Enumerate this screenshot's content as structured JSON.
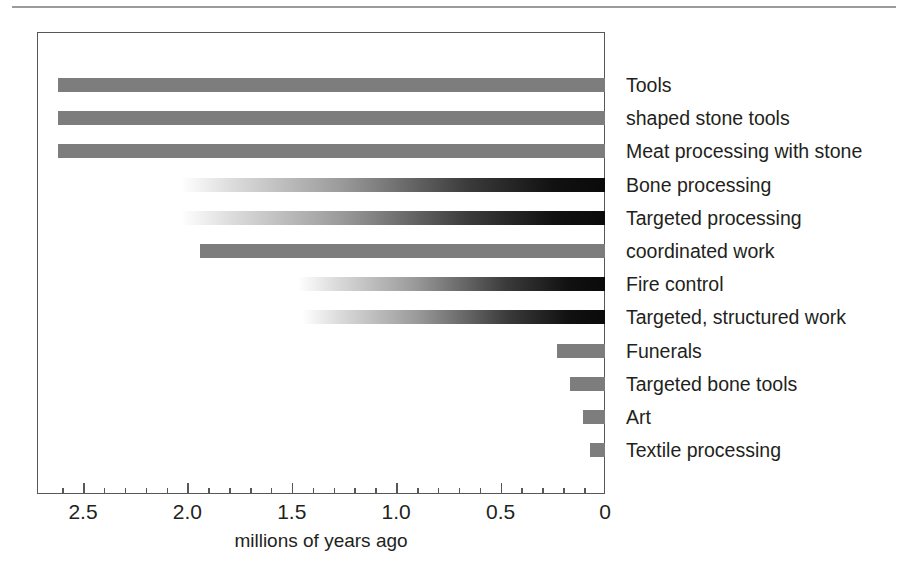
{
  "figure": {
    "background_color": "#ffffff",
    "rule_color": "#9b9b9b",
    "frame_color": "#575757",
    "text_color": "#231f20"
  },
  "chart_data": {
    "type": "bar",
    "orientation": "horizontal",
    "title": "",
    "subtitle": "",
    "xlabel": "millions of years ago",
    "ylabel": "",
    "xlim": [
      2.72,
      0
    ],
    "x_axis_reversed": true,
    "grid": false,
    "legend": null,
    "tick_labels": [
      "2.5",
      "2.0",
      "1.5",
      "1.0",
      "0.5",
      "0"
    ],
    "tick_values": [
      2.5,
      2.0,
      1.5,
      1.0,
      0.5,
      0
    ],
    "minor_tick_step": 0.1,
    "bar_colors": {
      "solid_gray": "#7d7d7d",
      "gradient_black": "#0a0a0a",
      "gradient_start": "#ffffff"
    },
    "categories": [
      "Tools",
      "shaped stone tools",
      "Meat processing with stone",
      "Bone processing",
      "Targeted processing",
      "coordinated work",
      "Fire control",
      "Targeted, structured work",
      "Funerals",
      "Targeted bone tools",
      "Art",
      "Textile processing"
    ],
    "values": [
      2.62,
      2.62,
      2.62,
      2.03,
      2.03,
      1.94,
      1.47,
      1.45,
      0.23,
      0.17,
      0.105,
      0.07
    ],
    "bars": [
      {
        "label": "Tools",
        "value": 2.62,
        "style": "solid"
      },
      {
        "label": "shaped stone tools",
        "value": 2.62,
        "style": "solid"
      },
      {
        "label": "Meat processing with stone",
        "value": 2.62,
        "style": "solid"
      },
      {
        "label": "Bone processing",
        "value": 2.03,
        "style": "fade"
      },
      {
        "label": "Targeted processing",
        "value": 2.03,
        "style": "fade"
      },
      {
        "label": "coordinated work",
        "value": 1.94,
        "style": "solid"
      },
      {
        "label": "Fire control",
        "value": 1.47,
        "style": "fade"
      },
      {
        "label": "Targeted, structured work",
        "value": 1.45,
        "style": "fade"
      },
      {
        "label": "Funerals",
        "value": 0.23,
        "style": "solid"
      },
      {
        "label": "Targeted bone tools",
        "value": 0.17,
        "style": "solid"
      },
      {
        "label": "Art",
        "value": 0.105,
        "style": "solid"
      },
      {
        "label": "Textile processing",
        "value": 0.07,
        "style": "solid"
      }
    ]
  },
  "axis": {
    "title": "millions of years ago",
    "ticks": [
      {
        "label": "2.5",
        "value": 2.5
      },
      {
        "label": "2.0",
        "value": 2.0
      },
      {
        "label": "1.5",
        "value": 1.5
      },
      {
        "label": "1.0",
        "value": 1.0
      },
      {
        "label": "0.5",
        "value": 0.5
      },
      {
        "label": "0",
        "value": 0
      }
    ]
  },
  "labels": {
    "items": [
      "Tools",
      "shaped stone tools",
      "Meat processing with stone",
      "Bone processing",
      "Targeted processing",
      "coordinated work",
      "Fire control",
      "Targeted, structured work",
      "Funerals",
      "Targeted bone tools",
      "Art",
      "Textile processing"
    ]
  }
}
